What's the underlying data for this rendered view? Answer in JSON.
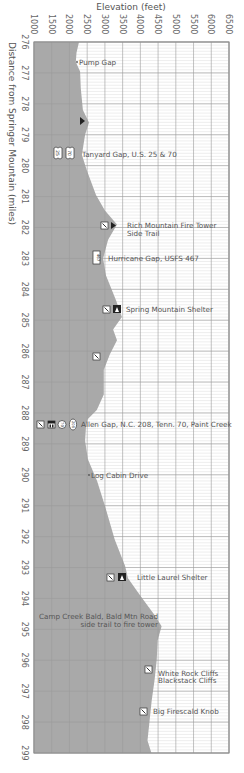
{
  "chart_data": {
    "type": "area",
    "orientation": "vertical-profile",
    "title": "",
    "xlabel": "Elevation (feet)",
    "ylabel": "Distance from Springer Mountain (miles)",
    "xlim": [
      1000,
      6500
    ],
    "ylim": [
      276,
      299
    ],
    "grid": true,
    "x_ticks": [
      1000,
      1500,
      2000,
      2500,
      3000,
      3500,
      4000,
      4500,
      5000,
      5500,
      6000,
      6500
    ],
    "y_ticks": [
      276,
      277,
      278,
      279,
      280,
      281,
      282,
      283,
      284,
      285,
      286,
      287,
      288,
      289,
      290,
      291,
      292,
      293,
      294,
      295,
      296,
      297,
      298,
      299
    ],
    "profile": [
      {
        "mile": 276.0,
        "elev": 2270
      },
      {
        "mile": 276.35,
        "elev": 2200
      },
      {
        "mile": 276.65,
        "elev": 2180
      },
      {
        "mile": 276.95,
        "elev": 2300
      },
      {
        "mile": 277.5,
        "elev": 2320
      },
      {
        "mile": 278.2,
        "elev": 2380
      },
      {
        "mile": 278.6,
        "elev": 2550
      },
      {
        "mile": 279.0,
        "elev": 2440
      },
      {
        "mile": 279.65,
        "elev": 2350
      },
      {
        "mile": 280.15,
        "elev": 2490
      },
      {
        "mile": 280.95,
        "elev": 2750
      },
      {
        "mile": 281.45,
        "elev": 3000
      },
      {
        "mile": 281.9,
        "elev": 3340
      },
      {
        "mile": 282.4,
        "elev": 3090
      },
      {
        "mile": 283.0,
        "elev": 2950
      },
      {
        "mile": 283.55,
        "elev": 3030
      },
      {
        "mile": 284.35,
        "elev": 3310
      },
      {
        "mile": 284.9,
        "elev": 3480
      },
      {
        "mile": 285.3,
        "elev": 3230
      },
      {
        "mile": 285.65,
        "elev": 3340
      },
      {
        "mile": 286.1,
        "elev": 3140
      },
      {
        "mile": 286.6,
        "elev": 2970
      },
      {
        "mile": 287.4,
        "elev": 2970
      },
      {
        "mile": 287.9,
        "elev": 2770
      },
      {
        "mile": 288.2,
        "elev": 2520
      },
      {
        "mile": 288.4,
        "elev": 2470
      },
      {
        "mile": 288.9,
        "elev": 2440
      },
      {
        "mile": 289.5,
        "elev": 2520
      },
      {
        "mile": 290.2,
        "elev": 2780
      },
      {
        "mile": 291.0,
        "elev": 3000
      },
      {
        "mile": 292.1,
        "elev": 3280
      },
      {
        "mile": 292.95,
        "elev": 3570
      },
      {
        "mile": 293.35,
        "elev": 3650
      },
      {
        "mile": 293.9,
        "elev": 3990
      },
      {
        "mile": 294.55,
        "elev": 4410
      },
      {
        "mile": 294.9,
        "elev": 4600
      },
      {
        "mile": 295.35,
        "elev": 4490
      },
      {
        "mile": 296.0,
        "elev": 4460
      },
      {
        "mile": 296.65,
        "elev": 4400
      },
      {
        "mile": 297.3,
        "elev": 4320
      },
      {
        "mile": 297.95,
        "elev": 4260
      },
      {
        "mile": 298.6,
        "elev": 4200
      },
      {
        "mile": 299.0,
        "elev": 4310
      }
    ],
    "annotations": [
      {
        "mile": 276.65,
        "label": "Pump Gap",
        "icons": []
      },
      {
        "mile": 278.6,
        "label": "",
        "icons": [
          "campsite-tent"
        ]
      },
      {
        "mile": 279.65,
        "label": "Tanyard Gap, U.S. 25 & 70",
        "icons": [
          "us-highway-25",
          "us-highway-70"
        ]
      },
      {
        "mile": 281.9,
        "label": "Rich Mountain Fire Tower Side Trail",
        "icons": [
          "viewpoint",
          "campsite-tent"
        ]
      },
      {
        "mile": 283.0,
        "label": "Hurricane Gap, USFS 467",
        "icons": [
          "forest-road-467"
        ]
      },
      {
        "mile": 284.9,
        "label": "Spring Mountain Shelter",
        "icons": [
          "viewpoint",
          "shelter"
        ]
      },
      {
        "mile": 286.2,
        "label": "",
        "icons": [
          "viewpoint"
        ]
      },
      {
        "mile": 288.4,
        "label": "Allen Gap, N.C. 208, Tenn. 70, Paint Creek",
        "icons": [
          "viewpoint",
          "parking",
          "state-route-70",
          "state-route-208"
        ]
      },
      {
        "mile": 290.1,
        "label": "Log Cabin Drive",
        "icons": []
      },
      {
        "mile": 293.35,
        "label": "Little Laurel Shelter",
        "icons": [
          "viewpoint",
          "shelter"
        ]
      },
      {
        "mile": 294.9,
        "label": "Camp Creek Bald, Bald Mtn Road side trail to fire tower",
        "icons": []
      },
      {
        "mile": 296.5,
        "label": "White Rock Cliffs Blackstack Cliffs",
        "icons": [
          "viewpoint"
        ]
      },
      {
        "mile": 297.8,
        "label": "Big Firescald Knob",
        "icons": [
          "viewpoint"
        ]
      }
    ]
  },
  "axes": {
    "x_title": "Elevation (feet)",
    "y_title": "Distance from Springer Mountain (miles)"
  },
  "labels": {
    "pump_gap": "Pump Gap",
    "tanyard_gap": "Tanyard Gap, U.S. 25 & 70",
    "rich_mtn_1": "Rich Mountain Fire Tower",
    "rich_mtn_2": "Side Trail",
    "hurricane_gap": "Hurricane Gap, USFS 467",
    "spring_mtn": "Spring Mountain Shelter",
    "allen_gap": "Allen Gap, N.C. 208, Tenn. 70, Paint Creek",
    "log_cabin": "Log Cabin Drive",
    "little_laurel": "Little Laurel Shelter",
    "camp_creek_1": "Camp Creek Bald, Bald Mtn Road",
    "camp_creek_2": "side trail to fire tower",
    "white_rock_1": "White Rock Cliffs",
    "white_rock_2": "Blackstack Cliffs",
    "big_firescald": "Big Firescald Knob"
  },
  "icon_text": {
    "us25": "25",
    "us70": "70",
    "usfs467": "467",
    "nc70": "70",
    "nc208": "208"
  },
  "colors": {
    "fill": "#a9a9a9",
    "grid_major": "#9a9a9a",
    "grid_minor": "#d4d4d4",
    "background": "#ffffff",
    "text": "#555555"
  }
}
